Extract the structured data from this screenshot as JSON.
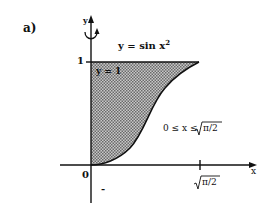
{
  "figure": {
    "panel_label": "a)",
    "curve_label": "y = sin x",
    "curve_exponent": "2",
    "line_label": "y = 1",
    "domain_label_prefix": "0 ≤ x ≤ ",
    "domain_label_root": "π/2",
    "y_axis_label": "y",
    "x_axis_label": "x",
    "y_tick_label": "1",
    "origin_label": "0",
    "x_tick_root": "π/2",
    "minus_mark": "-",
    "colors": {
      "ink": "#111111",
      "shade": "#9a9a9a",
      "background": "#ffffff"
    }
  }
}
